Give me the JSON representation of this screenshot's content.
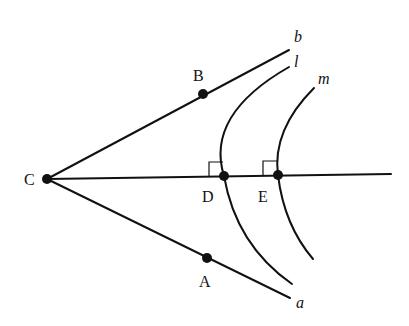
{
  "diagram": {
    "title": "",
    "points": {
      "C": {
        "label": "C",
        "x": 47,
        "y": 179
      },
      "B": {
        "label": "B",
        "x": 203,
        "y": 94
      },
      "A": {
        "label": "A",
        "x": 207,
        "y": 258
      },
      "D": {
        "label": "D",
        "x": 224,
        "y": 176
      },
      "E": {
        "label": "E",
        "x": 278,
        "y": 175
      }
    },
    "rays": {
      "b": {
        "label": "b",
        "from": "C",
        "through": "B"
      },
      "a": {
        "label": "a",
        "from": "C",
        "through": "A"
      }
    },
    "arcs": {
      "l": {
        "label": "l",
        "through": "D",
        "perpendicular_to": "CD"
      },
      "m": {
        "label": "m",
        "through": "E",
        "perpendicular_to": "CE"
      }
    },
    "bisector": {
      "from": "C",
      "through": [
        "D",
        "E"
      ]
    },
    "right_angle_marks": [
      "D",
      "E"
    ],
    "colors": {
      "stroke": "#111111",
      "background": "#ffffff"
    }
  }
}
